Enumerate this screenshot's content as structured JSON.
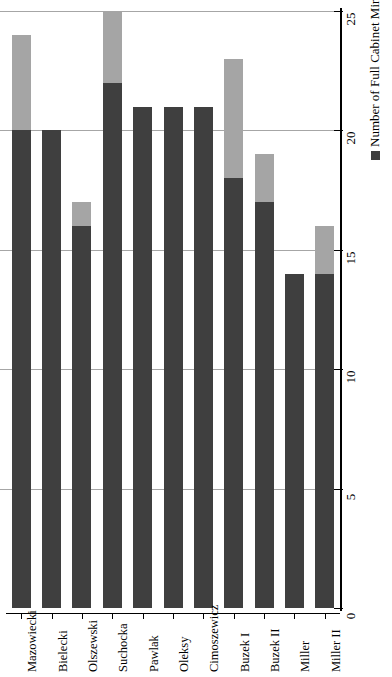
{
  "chart_data": {
    "type": "bar",
    "orientation": "vertical-rotated",
    "title": "",
    "subtitle": "",
    "xlabel": "",
    "ylabel": "",
    "ylim": [
      0,
      25
    ],
    "ytick_values": [
      0,
      5,
      10,
      15,
      20,
      25
    ],
    "ytick_labels": [
      "0",
      "5",
      "10",
      "15",
      "20",
      "25"
    ],
    "grid": true,
    "stacked": true,
    "legend_position": "bottom-right-rotated",
    "categories": [
      "Mazowiecki",
      "Bielecki",
      "Olszewski",
      "Suchocka",
      "Pawlak",
      "Oleksy",
      "Cimoszewicz",
      "Buzek I",
      "Buzek II",
      "Miller",
      "Miller II"
    ],
    "series": [
      {
        "name": "Number of Full Cabinet Ministers",
        "color": "#3f3f3f",
        "values": [
          20,
          20,
          16,
          22,
          21,
          21,
          21,
          18,
          17,
          14,
          14
        ]
      },
      {
        "name": "Number of Ministers without Portfolio",
        "color": "#a5a5a5",
        "values": [
          4,
          0,
          1,
          3,
          0,
          0,
          0,
          5,
          2,
          0,
          2
        ]
      }
    ],
    "totals": [
      24,
      20,
      17,
      25,
      21,
      21,
      21,
      23,
      19,
      14,
      16
    ]
  },
  "legend": {
    "items": [
      {
        "label": "Number of Full Cabinet Ministers",
        "color": "#3f3f3f"
      },
      {
        "label": "Number of Ministers without Portfolio",
        "color": "#a5a5a5"
      }
    ]
  },
  "axis": {
    "value_axis_ticks": [
      "0",
      "5",
      "10",
      "15",
      "20",
      "25"
    ]
  }
}
